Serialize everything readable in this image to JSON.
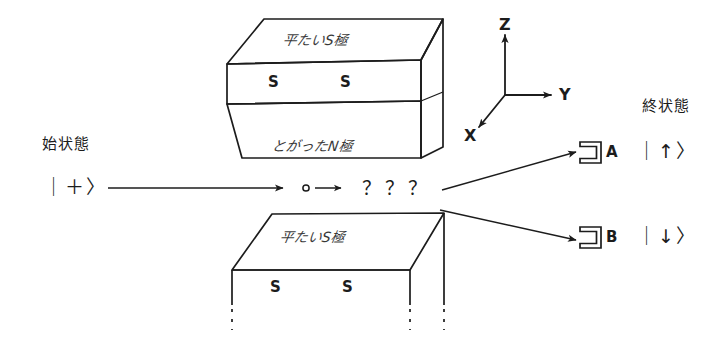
{
  "figure": {
    "title_alt": "Stern-Gerlach spin measurement schematic",
    "ink_color": "#1c1c1c"
  },
  "initial": {
    "label": "始状態",
    "ket": "｜＋〉"
  },
  "final": {
    "label": "終状態"
  },
  "beam": {
    "particle_marker": "◦",
    "short_arrow": "→",
    "unknown": "？？？"
  },
  "magnet_top": {
    "top_face_text": "平たいS極",
    "bottom_face_text": "とがったN極",
    "pole_labels": [
      "S",
      "S"
    ]
  },
  "magnet_bottom": {
    "top_face_text": "平たいS極",
    "pole_labels": [
      "S",
      "S"
    ]
  },
  "axes": {
    "z": "Z",
    "y": "Y",
    "x": "X"
  },
  "detectors": [
    {
      "name": "A",
      "ket": "｜↑〉"
    },
    {
      "name": "B",
      "ket": "｜↓〉"
    }
  ]
}
